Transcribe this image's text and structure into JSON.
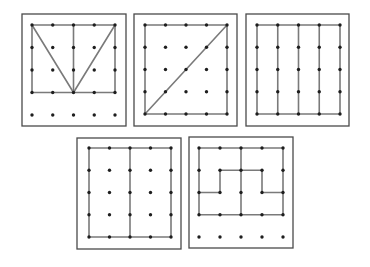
{
  "figure": {
    "colors": {
      "frame": "#4a4a4a",
      "band": "#7a7a7a",
      "peg": "#1e1e1e",
      "background": "#ffffff"
    },
    "grid_size": 5,
    "boards": [
      {
        "id": "board-1",
        "frame": {
          "x": 22,
          "y": 14,
          "w": 104,
          "h": 112
        },
        "peg_origin": {
          "x": 32,
          "y": 25
        },
        "peg_step": {
          "x": 20.75,
          "y": 22.5
        },
        "bands": [
          {
            "name": "outer-rectangle",
            "points": [
              [
                0,
                0
              ],
              [
                4,
                0
              ],
              [
                4,
                3
              ],
              [
                0,
                3
              ],
              [
                0,
                0
              ]
            ]
          },
          {
            "name": "center-vertical",
            "points": [
              [
                2,
                0
              ],
              [
                2,
                3
              ]
            ]
          },
          {
            "name": "left-diagonal",
            "points": [
              [
                0,
                0
              ],
              [
                2,
                3
              ]
            ]
          },
          {
            "name": "right-diagonal",
            "points": [
              [
                4,
                0
              ],
              [
                2,
                3
              ]
            ]
          }
        ]
      },
      {
        "id": "board-2",
        "frame": {
          "x": 134,
          "y": 14,
          "w": 103,
          "h": 112
        },
        "peg_origin": {
          "x": 145,
          "y": 25
        },
        "peg_step": {
          "x": 20.5,
          "y": 22.25
        },
        "bands": [
          {
            "name": "outer-square",
            "points": [
              [
                0,
                0
              ],
              [
                4,
                0
              ],
              [
                4,
                4
              ],
              [
                0,
                4
              ],
              [
                0,
                0
              ]
            ]
          },
          {
            "name": "diagonal",
            "points": [
              [
                0,
                4
              ],
              [
                4,
                0
              ]
            ]
          }
        ]
      },
      {
        "id": "board-3",
        "frame": {
          "x": 246,
          "y": 14,
          "w": 103,
          "h": 112
        },
        "peg_origin": {
          "x": 257,
          "y": 25
        },
        "peg_step": {
          "x": 20.75,
          "y": 22.25
        },
        "bands": [
          {
            "name": "outer-square",
            "points": [
              [
                0,
                0
              ],
              [
                4,
                0
              ],
              [
                4,
                4
              ],
              [
                0,
                4
              ],
              [
                0,
                0
              ]
            ]
          },
          {
            "name": "vertical-1",
            "points": [
              [
                1,
                0
              ],
              [
                1,
                4
              ]
            ]
          },
          {
            "name": "vertical-2",
            "points": [
              [
                2,
                0
              ],
              [
                2,
                4
              ]
            ]
          },
          {
            "name": "vertical-3",
            "points": [
              [
                3,
                0
              ],
              [
                3,
                4
              ]
            ]
          }
        ]
      },
      {
        "id": "board-4",
        "frame": {
          "x": 77,
          "y": 138,
          "w": 104,
          "h": 111
        },
        "peg_origin": {
          "x": 89,
          "y": 148
        },
        "peg_step": {
          "x": 20.5,
          "y": 22.25
        },
        "bands": [
          {
            "name": "outer-square",
            "points": [
              [
                0,
                0
              ],
              [
                4,
                0
              ],
              [
                4,
                4
              ],
              [
                0,
                4
              ],
              [
                0,
                0
              ]
            ]
          },
          {
            "name": "center-vertical",
            "points": [
              [
                2,
                0
              ],
              [
                2,
                4
              ]
            ]
          }
        ]
      },
      {
        "id": "board-5",
        "frame": {
          "x": 189,
          "y": 137,
          "w": 104,
          "h": 111
        },
        "peg_origin": {
          "x": 199,
          "y": 148
        },
        "peg_step": {
          "x": 21,
          "y": 22.25
        },
        "bands": [
          {
            "name": "outer-rectangle",
            "points": [
              [
                0,
                0
              ],
              [
                4,
                0
              ],
              [
                4,
                3
              ],
              [
                0,
                3
              ],
              [
                0,
                0
              ]
            ]
          },
          {
            "name": "center-vertical",
            "points": [
              [
                2,
                0
              ],
              [
                2,
                3
              ]
            ]
          },
          {
            "name": "inner-step-path",
            "points": [
              [
                0,
                2
              ],
              [
                1,
                2
              ],
              [
                1,
                1
              ],
              [
                3,
                1
              ],
              [
                3,
                2
              ],
              [
                4,
                2
              ]
            ]
          }
        ]
      }
    ]
  }
}
